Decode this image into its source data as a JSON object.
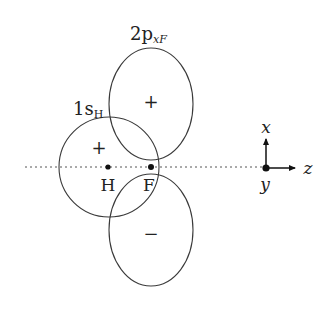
{
  "diagram": {
    "orbital_labels": {
      "p_orbital": {
        "main": "2p",
        "sub": "xF"
      },
      "s_orbital": {
        "main": "1s",
        "sub": "H"
      }
    },
    "phase_signs": {
      "p_upper_lobe": "+",
      "p_lower_lobe": "−",
      "s_orbital": "+"
    },
    "atoms": [
      {
        "label": "H"
      },
      {
        "label": "F"
      }
    ],
    "axes": {
      "up": "x",
      "right": "z",
      "out_of_page": "y"
    },
    "colors": {
      "line": "#3a3a3a",
      "text": "#222222"
    }
  }
}
